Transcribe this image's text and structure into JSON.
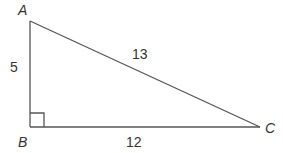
{
  "diagram": {
    "vertices": {
      "A": {
        "label": "A",
        "x": 30,
        "y": 21
      },
      "B": {
        "label": "B",
        "x": 30,
        "y": 127
      },
      "C": {
        "label": "C",
        "x": 260,
        "y": 127
      }
    },
    "sides": {
      "AB": {
        "label": "5"
      },
      "BC": {
        "label": "12"
      },
      "AC": {
        "label": "13"
      }
    },
    "right_angle_at": "B",
    "line_color": "#555555",
    "text_color": "#333333"
  }
}
